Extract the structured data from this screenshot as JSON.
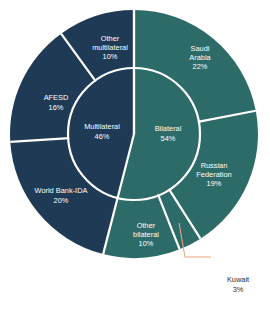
{
  "chart_data": {
    "type": "pie",
    "title": "",
    "subtitle": "",
    "xlabel": "",
    "ylabel": "",
    "legend_position": "none",
    "grid": false,
    "variant": "nested-donut-sunburst",
    "center": {
      "x": 134,
      "y": 134
    },
    "inner_radius": 66,
    "outer_radius": 124,
    "start_angle_deg": -90,
    "direction": "clockwise",
    "separator_color": "#ffffff",
    "colors": {
      "bilateral": "#2C6B68",
      "multilateral": "#1E3A55",
      "leader_line": "#E8A87C",
      "label_text": "#ffffff",
      "callout_text": "#2b2b2b",
      "background": "#ffffff"
    },
    "inner_ring": {
      "name": "Aid source type",
      "categories": [
        "Bilateral",
        "Multilateral"
      ],
      "values": [
        54,
        46
      ],
      "unit": "%",
      "slices": [
        {
          "label": "Bilateral",
          "value": 54,
          "value_label": "54%",
          "color": "#2C6B68",
          "label_x": 168,
          "label_y": 134
        },
        {
          "label": "Multilateral",
          "value": 46,
          "value_label": "46%",
          "color": "#1E3A55",
          "label_x": 102,
          "label_y": 132
        }
      ]
    },
    "outer_ring": {
      "name": "Donor",
      "categories": [
        "Saudi Arabia",
        "Russian Federation",
        "Kuwait",
        "Other bilateral",
        "World Bank-IDA",
        "AFESD",
        "Other multilateral"
      ],
      "values": [
        22,
        19,
        3,
        10,
        20,
        16,
        10
      ],
      "unit": "%",
      "slices": [
        {
          "label": "Saudi Arabia",
          "value": 22,
          "value_label": "22%",
          "color": "#2C6B68",
          "parent": "Bilateral",
          "lines": [
            "Saudi",
            "Arabia",
            "22%"
          ],
          "label_x": 200,
          "label_y": 58
        },
        {
          "label": "Russian Federation",
          "value": 19,
          "value_label": "19%",
          "color": "#2C6B68",
          "parent": "Bilateral",
          "lines": [
            "Russian",
            "Federation",
            "19%"
          ],
          "label_x": 214,
          "label_y": 175
        },
        {
          "label": "Kuwait",
          "value": 3,
          "value_label": "3%",
          "color": "#2C6B68",
          "parent": "Bilateral",
          "lines": [
            "Kuwait",
            "3%"
          ],
          "label_x": 238,
          "label_y": 285,
          "callout": true
        },
        {
          "label": "Other bilateral",
          "value": 10,
          "value_label": "10%",
          "color": "#2C6B68",
          "parent": "Bilateral",
          "lines": [
            "Other",
            "bilateral",
            "10%"
          ],
          "label_x": 146,
          "label_y": 235
        },
        {
          "label": "World Bank-IDA",
          "value": 20,
          "value_label": "20%",
          "color": "#1E3A55",
          "parent": "Multilateral",
          "lines": [
            "World Bank-IDA",
            "20%"
          ],
          "label_x": 61,
          "label_y": 196
        },
        {
          "label": "AFESD",
          "value": 16,
          "value_label": "16%",
          "color": "#1E3A55",
          "parent": "Multilateral",
          "lines": [
            "AFESD",
            "16%"
          ],
          "label_x": 56,
          "label_y": 103
        },
        {
          "label": "Other multilateral",
          "value": 10,
          "value_label": "10%",
          "color": "#1E3A55",
          "parent": "Multilateral",
          "lines": [
            "Other",
            "multilateral",
            "10%"
          ],
          "label_x": 110,
          "label_y": 48
        }
      ]
    },
    "callout": {
      "label": "Kuwait",
      "value_label": "3%",
      "line_color": "#E8A87C",
      "points": "179,223 185,257 211,257"
    }
  }
}
